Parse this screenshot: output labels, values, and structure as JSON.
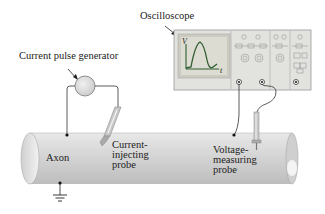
{
  "labels": {
    "oscilloscope": "Oscilloscope",
    "pulse_generator": "Current pulse generator",
    "axon": "Axon",
    "current_probe": [
      "Current-",
      "injecting",
      "probe"
    ],
    "voltage_probe": [
      "Voltage-",
      "measuring",
      "probe"
    ],
    "screen_y_axis": "V",
    "screen_x_axis": "t"
  },
  "colors": {
    "axon_fill": "#d6d6d6",
    "oscilloscope_body": "#e0e0de",
    "screen_bg": "#d8d8d0",
    "trace": "#333333",
    "wire": "#333333",
    "generator_fill": "#dcdcdc"
  }
}
